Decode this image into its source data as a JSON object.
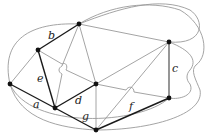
{
  "diagram": {
    "type": "graph",
    "nodes": [
      {
        "id": "n1",
        "x": 10,
        "y": 84
      },
      {
        "id": "n2",
        "x": 79,
        "y": 24
      },
      {
        "id": "n3",
        "x": 38,
        "y": 50
      },
      {
        "id": "n4",
        "x": 169,
        "y": 42
      },
      {
        "id": "n5",
        "x": 169,
        "y": 98
      },
      {
        "id": "n6",
        "x": 55,
        "y": 108
      },
      {
        "id": "n7",
        "x": 96,
        "y": 84
      },
      {
        "id": "n8",
        "x": 96,
        "y": 130
      }
    ],
    "labels": {
      "a": "a",
      "b": "b",
      "c": "c",
      "d": "d",
      "e": "e",
      "f": "f",
      "g": "g"
    },
    "colors": {
      "light_edge": "#9a9a9a",
      "dark_edge": "#1a1a1a",
      "node": "#111111"
    }
  }
}
